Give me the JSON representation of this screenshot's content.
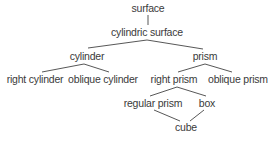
{
  "diagram": {
    "type": "hierarchy",
    "nodes": {
      "surface": {
        "label": "surface",
        "x": 148,
        "y": 8
      },
      "cylindric_surface": {
        "label": "cylindric surface",
        "x": 147,
        "y": 32
      },
      "cylinder": {
        "label": "cylinder",
        "x": 87,
        "y": 56
      },
      "prism": {
        "label": "prism",
        "x": 205,
        "y": 56
      },
      "right_cylinder": {
        "label": "right cylinder",
        "x": 35,
        "y": 79
      },
      "oblique_cylinder": {
        "label": "oblique cylinder",
        "x": 103,
        "y": 79
      },
      "right_prism": {
        "label": "right prism",
        "x": 174,
        "y": 79
      },
      "oblique_prism": {
        "label": "oblique prism",
        "x": 238,
        "y": 79
      },
      "regular_prism": {
        "label": "regular prism",
        "x": 153,
        "y": 103
      },
      "box": {
        "label": "box",
        "x": 207,
        "y": 103
      },
      "cube": {
        "label": "cube",
        "x": 186,
        "y": 127
      }
    },
    "edges": [
      {
        "from": "surface",
        "to": "cylindric_surface",
        "x1": 148,
        "y1": 15,
        "x2": 148,
        "y2": 25
      },
      {
        "from": "cylindric_surface",
        "to": "cylinder",
        "x1": 147,
        "y1": 40,
        "x2": 88,
        "y2": 48
      },
      {
        "from": "cylindric_surface",
        "to": "prism",
        "x1": 147,
        "y1": 40,
        "x2": 203,
        "y2": 49
      },
      {
        "from": "cylinder",
        "to": "right_cylinder",
        "x1": 84,
        "y1": 64,
        "x2": 42,
        "y2": 72
      },
      {
        "from": "cylinder",
        "to": "oblique_cylinder",
        "x1": 84,
        "y1": 64,
        "x2": 109,
        "y2": 72
      },
      {
        "from": "prism",
        "to": "right_prism",
        "x1": 205,
        "y1": 64,
        "x2": 178,
        "y2": 72
      },
      {
        "from": "prism",
        "to": "oblique_prism",
        "x1": 205,
        "y1": 64,
        "x2": 232,
        "y2": 72
      },
      {
        "from": "right_prism",
        "to": "regular_prism",
        "x1": 177,
        "y1": 87,
        "x2": 150,
        "y2": 96
      },
      {
        "from": "right_prism",
        "to": "box",
        "x1": 177,
        "y1": 87,
        "x2": 206,
        "y2": 96
      },
      {
        "from": "regular_prism",
        "to": "cube",
        "x1": 154,
        "y1": 110,
        "x2": 180,
        "y2": 121
      },
      {
        "from": "box",
        "to": "cube",
        "x1": 204,
        "y1": 110,
        "x2": 190,
        "y2": 121
      }
    ]
  }
}
